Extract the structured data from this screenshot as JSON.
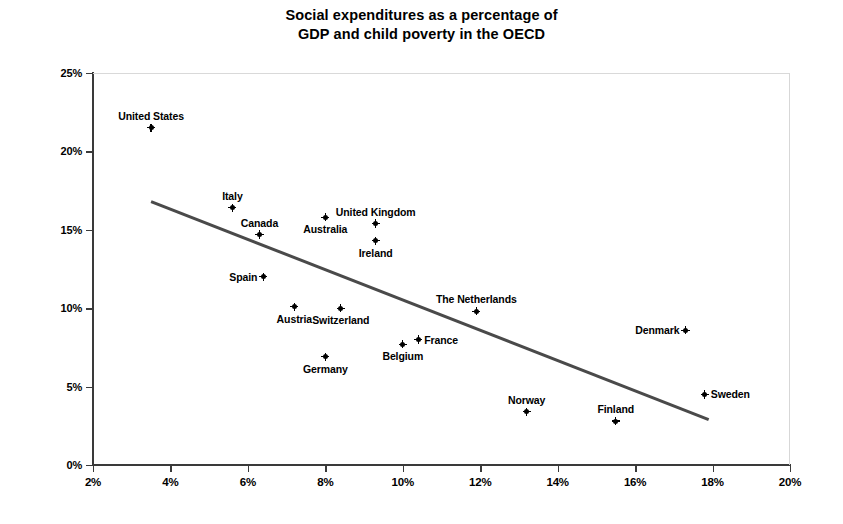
{
  "chart_data": {
    "type": "scatter",
    "title": "Social expenditures as a percentage of GDP and child poverty in the OECD",
    "title_lines": [
      "Social expenditures as a percentage of",
      "GDP and child poverty in the OECD"
    ],
    "xlabel": "",
    "ylabel": "Child poverty rate",
    "xlim": [
      2,
      20
    ],
    "ylim": [
      0,
      25
    ],
    "xticks": [
      "2%",
      "4%",
      "6%",
      "8%",
      "10%",
      "12%",
      "14%",
      "16%",
      "18%",
      "20%"
    ],
    "xtick_values": [
      2,
      4,
      6,
      8,
      10,
      12,
      14,
      16,
      18,
      20
    ],
    "yticks": [
      "0%",
      "5%",
      "10%",
      "15%",
      "20%",
      "25%"
    ],
    "ytick_values": [
      0,
      5,
      10,
      15,
      20,
      25
    ],
    "grid": false,
    "legend": "none",
    "marker": "plus-dot",
    "marker_color": "#000000",
    "points": [
      {
        "label": "United States",
        "x": 3.5,
        "y": 21.5,
        "label_pos": "above"
      },
      {
        "label": "Italy",
        "x": 5.6,
        "y": 16.4,
        "label_pos": "above"
      },
      {
        "label": "Canada",
        "x": 6.3,
        "y": 14.7,
        "label_pos": "above"
      },
      {
        "label": "Spain",
        "x": 6.4,
        "y": 12.0,
        "label_pos": "left"
      },
      {
        "label": "Austria",
        "x": 7.2,
        "y": 10.1,
        "label_pos": "below"
      },
      {
        "label": "Australia",
        "x": 8.0,
        "y": 15.8,
        "label_pos": "below"
      },
      {
        "label": "Switzerland",
        "x": 8.4,
        "y": 10.0,
        "label_pos": "below"
      },
      {
        "label": "Germany",
        "x": 8.0,
        "y": 6.9,
        "label_pos": "below"
      },
      {
        "label": "United Kingdom",
        "x": 9.3,
        "y": 15.4,
        "label_pos": "above"
      },
      {
        "label": "Ireland",
        "x": 9.3,
        "y": 14.3,
        "label_pos": "below"
      },
      {
        "label": "Belgium",
        "x": 10.0,
        "y": 7.7,
        "label_pos": "below"
      },
      {
        "label": "France",
        "x": 10.4,
        "y": 8.0,
        "label_pos": "right"
      },
      {
        "label": "The Netherlands",
        "x": 11.9,
        "y": 9.8,
        "label_pos": "above"
      },
      {
        "label": "Norway",
        "x": 13.2,
        "y": 3.4,
        "label_pos": "above"
      },
      {
        "label": "Finland",
        "x": 15.5,
        "y": 2.8,
        "label_pos": "above"
      },
      {
        "label": "Denmark",
        "x": 17.3,
        "y": 8.6,
        "label_pos": "left"
      },
      {
        "label": "Sweden",
        "x": 17.8,
        "y": 4.5,
        "label_pos": "right"
      }
    ],
    "trendline": {
      "x_start": 3.5,
      "y_start": 16.8,
      "x_end": 17.9,
      "y_end": 2.9,
      "color": "#4a4a4a",
      "width": 3
    }
  }
}
